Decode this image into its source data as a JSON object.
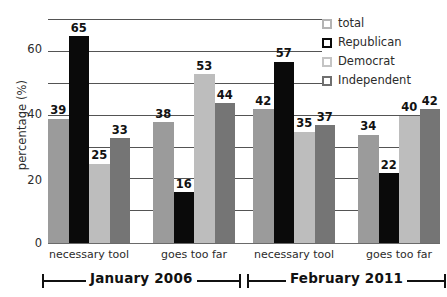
{
  "chart_data": {
    "type": "bar",
    "title": "",
    "xlabel": "",
    "ylabel": "percentage (%)",
    "ylim": [
      0,
      72
    ],
    "yticks": [
      0,
      20,
      40,
      60
    ],
    "ytick_labels": [
      "0",
      "20",
      "40",
      "60"
    ],
    "gridlines": [
      10,
      20,
      30,
      40,
      50,
      60,
      70
    ],
    "grid": true,
    "legend_position": "top-right",
    "categories": [
      "necessary tool",
      "goes too far",
      "necessary tool",
      "goes too far"
    ],
    "groups": [
      {
        "period": "January 2006",
        "categories": [
          {
            "label": "necessary tool",
            "bars": [
              {
                "series": "total",
                "value": 39,
                "label": "39",
                "color": "#9b9b9b"
              },
              {
                "series": "Republican",
                "value": 65,
                "label": "65",
                "color": "#0a0a0a"
              },
              {
                "series": "Democrat",
                "value": 25,
                "label": "25",
                "color": "#bdbdbd"
              },
              {
                "series": "Independent",
                "value": 33,
                "label": "33",
                "color": "#757575"
              }
            ]
          },
          {
            "label": "goes too far",
            "bars": [
              {
                "series": "total",
                "value": 38,
                "label": "38",
                "color": "#9b9b9b"
              },
              {
                "series": "Republican",
                "value": 16,
                "label": "16",
                "color": "#0a0a0a"
              },
              {
                "series": "Democrat",
                "value": 53,
                "label": "53",
                "color": "#bdbdbd"
              },
              {
                "series": "Independent",
                "value": 44,
                "label": "44",
                "color": "#757575"
              }
            ]
          }
        ]
      },
      {
        "period": "February 2011",
        "categories": [
          {
            "label": "necessary tool",
            "bars": [
              {
                "series": "total",
                "value": 42,
                "label": "42",
                "color": "#9b9b9b"
              },
              {
                "series": "Republican",
                "value": 57,
                "label": "57",
                "color": "#0a0a0a"
              },
              {
                "series": "Democrat",
                "value": 35,
                "label": "35",
                "color": "#bdbdbd"
              },
              {
                "series": "Independent",
                "value": 37,
                "label": "37",
                "color": "#757575"
              }
            ]
          },
          {
            "label": "goes too far",
            "bars": [
              {
                "series": "total",
                "value": 34,
                "label": "34",
                "color": "#9b9b9b"
              },
              {
                "series": "Republican",
                "value": 22,
                "label": "22",
                "color": "#0a0a0a"
              },
              {
                "series": "Democrat",
                "value": 40,
                "label": "40",
                "color": "#bdbdbd"
              },
              {
                "series": "Independent",
                "value": 42,
                "label": "42",
                "color": "#757575"
              }
            ]
          }
        ]
      }
    ],
    "series": [
      {
        "name": "total",
        "color": "#9b9b9b",
        "values": [
          39,
          38,
          42,
          34
        ]
      },
      {
        "name": "Republican",
        "color": "#0a0a0a",
        "values": [
          65,
          16,
          57,
          22
        ]
      },
      {
        "name": "Democrat",
        "color": "#bdbdbd",
        "values": [
          25,
          53,
          35,
          40
        ]
      },
      {
        "name": "Independent",
        "color": "#757575",
        "values": [
          33,
          44,
          37,
          42
        ]
      }
    ]
  },
  "legend": {
    "items": [
      {
        "label": "total",
        "swatch": "total"
      },
      {
        "label": "Republican",
        "swatch": "republican"
      },
      {
        "label": "Democrat",
        "swatch": "democrat"
      },
      {
        "label": "Independent",
        "swatch": "independent"
      }
    ]
  },
  "axes": {
    "y_title": "percentage (%)",
    "y_tick_labels": [
      "60",
      "40",
      "20",
      "0"
    ]
  },
  "group_brackets": [
    {
      "text": "January 2006"
    },
    {
      "text": "February 2011"
    }
  ],
  "clipped_title": ""
}
